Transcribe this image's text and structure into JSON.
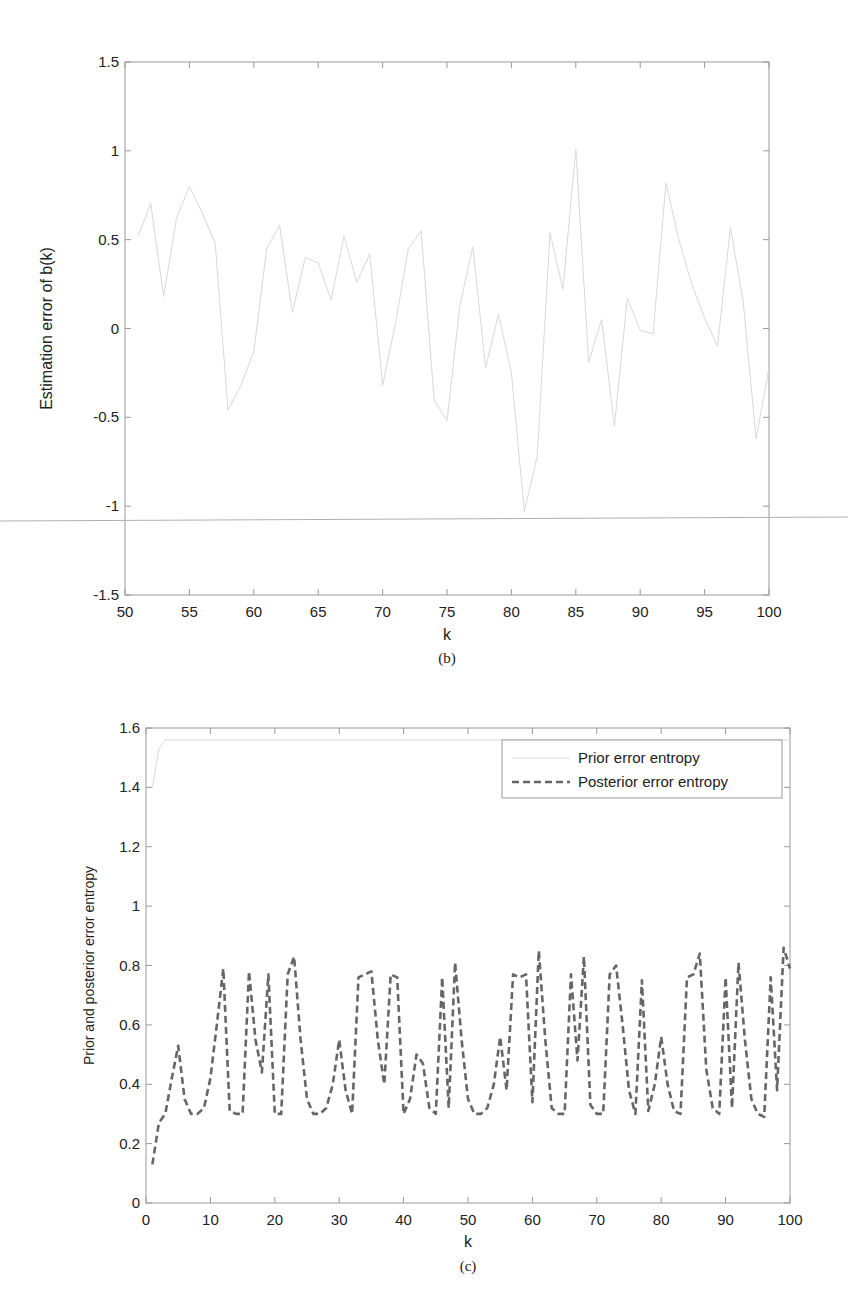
{
  "chart_data": [
    {
      "id": "b",
      "type": "line",
      "caption": "(b)",
      "title": "",
      "xlabel": "k",
      "ylabel": "Estimation error of b(k)",
      "xlim": [
        50,
        100
      ],
      "ylim": [
        -1.5,
        1.5
      ],
      "xticks": [
        50,
        55,
        60,
        65,
        70,
        75,
        80,
        85,
        90,
        95,
        100
      ],
      "xtick_labels": [
        "50",
        "55",
        "60",
        "65",
        "70",
        "75",
        "80",
        "85",
        "90",
        "95",
        "100"
      ],
      "yticks": [
        -1.5,
        -1,
        -0.5,
        0,
        0.5,
        1,
        1.5
      ],
      "ytick_labels": [
        "-1.5",
        "-1",
        "-0.5",
        "0",
        "0.5",
        "1",
        "1.5"
      ],
      "grid": false,
      "legend": null,
      "series": [
        {
          "name": "Estimation error of b(k)",
          "style": "solid",
          "color": "#d8d8d8",
          "x": [
            51,
            52,
            53,
            54,
            55,
            56,
            57,
            58,
            59,
            60,
            61,
            62,
            63,
            64,
            65,
            66,
            67,
            68,
            69,
            70,
            71,
            72,
            73,
            74,
            75,
            76,
            77,
            78,
            79,
            80,
            81,
            82,
            83,
            84,
            85,
            86,
            87,
            88,
            89,
            90,
            91,
            92,
            93,
            94,
            95,
            96,
            97,
            98,
            99,
            100
          ],
          "values": [
            0.52,
            0.7,
            0.18,
            0.62,
            0.8,
            0.65,
            0.48,
            -0.46,
            -0.32,
            -0.13,
            0.45,
            0.58,
            0.09,
            0.4,
            0.37,
            0.16,
            0.52,
            0.26,
            0.42,
            -0.32,
            0.03,
            0.45,
            0.55,
            -0.4,
            -0.52,
            0.13,
            0.46,
            -0.22,
            0.08,
            -0.25,
            -1.03,
            -0.72,
            0.54,
            0.22,
            1.01,
            -0.19,
            0.05,
            -0.55,
            0.17,
            -0.01,
            -0.03,
            0.82,
            0.5,
            0.25,
            0.06,
            -0.1,
            0.57,
            0.15,
            -0.62,
            -0.22
          ]
        }
      ],
      "annotations": [
        {
          "type": "hline",
          "note": "stray scan line across page",
          "y_value": -1.08
        }
      ]
    },
    {
      "id": "c",
      "type": "line",
      "caption": "(c)",
      "title": "",
      "xlabel": "k",
      "ylabel": "Prior and posterior error entropy",
      "xlim": [
        0,
        100
      ],
      "ylim": [
        0,
        1.6
      ],
      "xticks": [
        0,
        10,
        20,
        30,
        40,
        50,
        60,
        70,
        80,
        90,
        100
      ],
      "xtick_labels": [
        "0",
        "10",
        "20",
        "30",
        "40",
        "50",
        "60",
        "70",
        "80",
        "90",
        "100"
      ],
      "yticks": [
        0,
        0.2,
        0.4,
        0.6,
        0.8,
        1.0,
        1.2,
        1.4,
        1.6
      ],
      "ytick_labels": [
        "0",
        "0.2",
        "0.4",
        "0.6",
        "0.8",
        "1",
        "1.2",
        "1.4",
        "1.6"
      ],
      "grid": false,
      "legend": {
        "position": "upper right",
        "entries": [
          "Prior error entropy",
          "Posterior error entropy"
        ]
      },
      "series": [
        {
          "name": "Prior error entropy",
          "style": "solid",
          "color": "#d8d8d8",
          "x": [
            1,
            2,
            3,
            100
          ],
          "values": [
            1.4,
            1.53,
            1.56,
            1.56
          ]
        },
        {
          "name": "Posterior error entropy",
          "style": "dashed",
          "color": "#666666",
          "x": [
            1,
            2,
            3,
            4,
            5,
            6,
            7,
            8,
            9,
            10,
            11,
            12,
            13,
            14,
            15,
            16,
            17,
            18,
            19,
            20,
            21,
            22,
            23,
            24,
            25,
            26,
            27,
            28,
            29,
            30,
            31,
            32,
            33,
            34,
            35,
            36,
            37,
            38,
            39,
            40,
            41,
            42,
            43,
            44,
            45,
            46,
            47,
            48,
            49,
            50,
            51,
            52,
            53,
            54,
            55,
            56,
            57,
            58,
            59,
            60,
            61,
            62,
            63,
            64,
            65,
            66,
            67,
            68,
            69,
            70,
            71,
            72,
            73,
            74,
            75,
            76,
            77,
            78,
            79,
            80,
            81,
            82,
            83,
            84,
            85,
            86,
            87,
            88,
            89,
            90,
            91,
            92,
            93,
            94,
            95,
            96,
            97,
            98,
            99,
            100
          ],
          "values": [
            0.13,
            0.27,
            0.3,
            0.42,
            0.53,
            0.35,
            0.3,
            0.3,
            0.32,
            0.42,
            0.6,
            0.79,
            0.31,
            0.3,
            0.3,
            0.78,
            0.55,
            0.44,
            0.77,
            0.3,
            0.3,
            0.77,
            0.83,
            0.55,
            0.35,
            0.3,
            0.3,
            0.32,
            0.4,
            0.55,
            0.38,
            0.3,
            0.76,
            0.77,
            0.78,
            0.55,
            0.4,
            0.77,
            0.76,
            0.3,
            0.35,
            0.5,
            0.47,
            0.32,
            0.3,
            0.76,
            0.32,
            0.81,
            0.55,
            0.35,
            0.3,
            0.3,
            0.32,
            0.4,
            0.56,
            0.38,
            0.77,
            0.76,
            0.77,
            0.34,
            0.85,
            0.55,
            0.32,
            0.3,
            0.3,
            0.77,
            0.48,
            0.83,
            0.33,
            0.3,
            0.3,
            0.77,
            0.8,
            0.6,
            0.38,
            0.3,
            0.75,
            0.31,
            0.4,
            0.56,
            0.4,
            0.31,
            0.3,
            0.76,
            0.77,
            0.84,
            0.45,
            0.32,
            0.3,
            0.76,
            0.32,
            0.81,
            0.55,
            0.35,
            0.3,
            0.29,
            0.76,
            0.38,
            0.86,
            0.79
          ]
        }
      ]
    }
  ],
  "layout_meta": {
    "b": {
      "left": 125,
      "right": 769,
      "top": 62,
      "bottom": 595,
      "ylabel_x": 52,
      "xlabel_y": 640,
      "caption_y": 663,
      "stray_line": {
        "x1": 0,
        "y1": 521,
        "x2": 848,
        "y2": 517
      }
    },
    "c": {
      "left": 146,
      "right": 790,
      "top": 728,
      "bottom": 1203,
      "ylabel_x": 94,
      "xlabel_y": 1247,
      "caption_y": 1271,
      "legend": {
        "x": 502,
        "y": 740,
        "w": 280,
        "h": 58
      }
    }
  }
}
